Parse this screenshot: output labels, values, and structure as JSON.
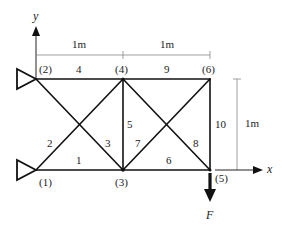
{
  "diagram": {
    "axes": {
      "x_label": "x",
      "y_label": "y"
    },
    "dimensions": {
      "top_left_span": "1m",
      "top_right_span": "1m",
      "right_height": "1m"
    },
    "nodes": [
      {
        "id": "1",
        "label": "(1)",
        "x": 36,
        "y": 170
      },
      {
        "id": "2",
        "label": "(2)",
        "x": 36,
        "y": 79
      },
      {
        "id": "3",
        "label": "(3)",
        "x": 123,
        "y": 170
      },
      {
        "id": "4",
        "label": "(4)",
        "x": 123,
        "y": 79
      },
      {
        "id": "5",
        "label": "(5)",
        "x": 210,
        "y": 170
      },
      {
        "id": "6",
        "label": "(6)",
        "x": 210,
        "y": 79
      }
    ],
    "members": [
      {
        "id": "1",
        "label": "1",
        "from": "1",
        "to": "3"
      },
      {
        "id": "2",
        "label": "2",
        "from": "1",
        "to": "4"
      },
      {
        "id": "3",
        "label": "3",
        "from": "2",
        "to": "3"
      },
      {
        "id": "4",
        "label": "4",
        "from": "2",
        "to": "4"
      },
      {
        "id": "5",
        "label": "5",
        "from": "3",
        "to": "4"
      },
      {
        "id": "6",
        "label": "6",
        "from": "3",
        "to": "5"
      },
      {
        "id": "7",
        "label": "7",
        "from": "3",
        "to": "6"
      },
      {
        "id": "8",
        "label": "8",
        "from": "4",
        "to": "5"
      },
      {
        "id": "9",
        "label": "9",
        "from": "4",
        "to": "6"
      },
      {
        "id": "10",
        "label": "10",
        "from": "5",
        "to": "6"
      }
    ],
    "supports": [
      {
        "node": "1",
        "type": "pin"
      },
      {
        "node": "2",
        "type": "pin"
      }
    ],
    "load": {
      "node": "5",
      "label": "F",
      "direction": "down"
    }
  }
}
